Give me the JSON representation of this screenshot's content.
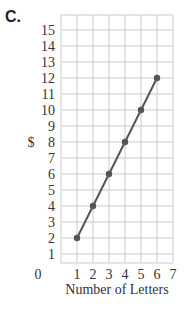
{
  "part_label": "C.",
  "chart_data": {
    "type": "line",
    "title": "",
    "xlabel": "Number of Letters",
    "ylabel": "$",
    "x": [
      1,
      2,
      3,
      4,
      5,
      6
    ],
    "values": [
      2,
      4,
      6,
      8,
      10,
      12
    ],
    "series": [
      {
        "name": "cost",
        "values": [
          2,
          4,
          6,
          8,
          10,
          12
        ]
      }
    ],
    "xlim": [
      0,
      7
    ],
    "ylim": [
      0,
      15
    ],
    "xticks": [
      0,
      1,
      2,
      3,
      4,
      5,
      6,
      7
    ],
    "yticks": [
      1,
      2,
      3,
      4,
      5,
      6,
      7,
      8,
      9,
      10,
      11,
      12,
      13,
      14,
      15
    ],
    "grid": true,
    "legend": "none",
    "colors": {
      "line": "#555555",
      "grid": "#cccccc",
      "text": "#333333"
    }
  }
}
